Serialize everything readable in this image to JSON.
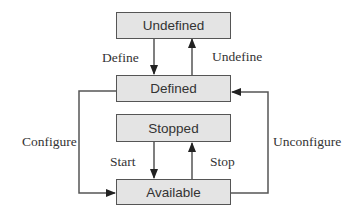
{
  "diagram": {
    "type": "state-transition",
    "states": [
      {
        "id": "undefined",
        "label": "Undefined"
      },
      {
        "id": "defined",
        "label": "Defined"
      },
      {
        "id": "stopped",
        "label": "Stopped"
      },
      {
        "id": "available",
        "label": "Available"
      }
    ],
    "transitions": [
      {
        "label": "Define",
        "from": "Undefined",
        "to": "Defined"
      },
      {
        "label": "Undefine",
        "from": "Defined",
        "to": "Undefined"
      },
      {
        "label": "Configure",
        "from": "Defined",
        "to": "Available"
      },
      {
        "label": "Unconfigure",
        "from": "Available",
        "to": "Defined"
      },
      {
        "label": "Start",
        "from": "Stopped",
        "to": "Available"
      },
      {
        "label": "Stop",
        "from": "Available",
        "to": "Stopped"
      }
    ],
    "colors": {
      "box_fill": "#e4e4e4",
      "box_border": "#555555",
      "line": "#555555",
      "text": "#333333"
    }
  }
}
